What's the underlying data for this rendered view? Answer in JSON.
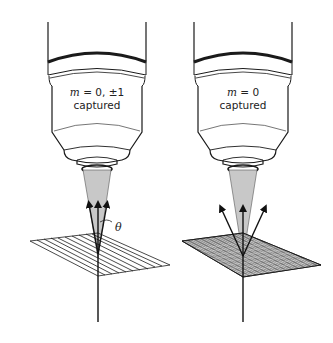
{
  "figure": {
    "panels": [
      {
        "id": "left",
        "label_line1_var": "m",
        "label_line1_rest": " = 0, ±1",
        "label_line2": "captured",
        "angle_label": "θ",
        "grating": "coarse",
        "diffracted_orders": [
          "-1",
          "0",
          "+1"
        ],
        "orders_captured": [
          "-1",
          "0",
          "+1"
        ]
      },
      {
        "id": "right",
        "label_line1_var": "m",
        "label_line1_rest": " = 0",
        "label_line2": "captured",
        "grating": "fine",
        "diffracted_orders": [
          "-1",
          "0",
          "+1"
        ],
        "orders_captured": [
          "0"
        ]
      }
    ],
    "colors": {
      "line": "#1a1a1a",
      "cone_fill": "#c8c8c8",
      "background": "#ffffff"
    }
  }
}
